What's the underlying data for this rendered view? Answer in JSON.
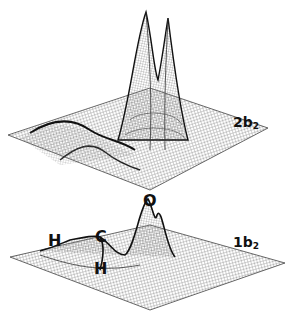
{
  "figure": {
    "panels": [
      {
        "id": "top",
        "orbital_label": {
          "main": "2b",
          "sub": "2"
        },
        "description": "3D wireframe orbital density surface with tall double peak"
      },
      {
        "id": "bottom",
        "orbital_label": {
          "main": "1b",
          "sub": "2"
        },
        "atom_labels": [
          "H",
          "C",
          "H",
          "O"
        ],
        "description": "3D wireframe orbital density surface with peaks near O, C and H atoms"
      }
    ],
    "colors": {
      "background": "#ffffff",
      "mesh": "#555555",
      "ink": "#111111"
    }
  }
}
